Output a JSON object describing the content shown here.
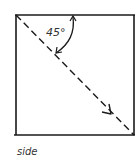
{
  "diagram": {
    "angle_label": "45°",
    "caption": "side",
    "colors": {
      "stroke": "#1a1a1a",
      "text": "#333333",
      "background": "#ffffff"
    }
  }
}
